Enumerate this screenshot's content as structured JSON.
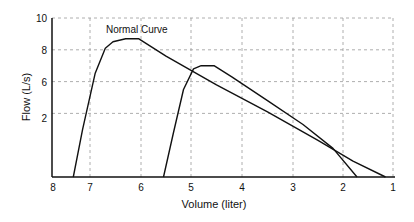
{
  "chart_data": {
    "type": "line",
    "title": "",
    "xlabel": "Volume (liter)",
    "ylabel": "Flow (L/s)",
    "xlim": [
      8,
      1
    ],
    "ylim": [
      0,
      10
    ],
    "x_reversed": true,
    "grid": true,
    "x_ticks": [
      "8",
      "7",
      "6",
      "5",
      "4",
      "3",
      "2",
      "1"
    ],
    "y_ticks": [
      {
        "label": "10",
        "value": 10
      },
      {
        "label": "8",
        "value": 8
      },
      {
        "label": "6",
        "value": 6
      },
      {
        "label": "2",
        "value": 4
      }
    ],
    "annotations": [
      {
        "text": "Normal Curve",
        "x": 6.9,
        "y": 9.2
      }
    ],
    "series": [
      {
        "name": "Normal Curve",
        "points": [
          [
            7.45,
            0
          ],
          [
            7.2,
            3.0
          ],
          [
            6.9,
            6.5
          ],
          [
            6.7,
            8.1
          ],
          [
            6.55,
            8.5
          ],
          [
            6.3,
            8.7
          ],
          [
            6.05,
            8.7
          ],
          [
            5.5,
            7.6
          ],
          [
            4.5,
            5.8
          ],
          [
            3.5,
            4.1
          ],
          [
            2.5,
            2.3
          ],
          [
            1.8,
            1.0
          ],
          [
            1.15,
            0
          ]
        ]
      },
      {
        "name": "Second Curve",
        "points": [
          [
            5.55,
            0
          ],
          [
            5.35,
            2.8
          ],
          [
            5.15,
            5.5
          ],
          [
            4.95,
            6.8
          ],
          [
            4.8,
            7.0
          ],
          [
            4.55,
            7.0
          ],
          [
            4.2,
            6.3
          ],
          [
            3.5,
            4.8
          ],
          [
            2.8,
            3.3
          ],
          [
            2.2,
            1.8
          ],
          [
            1.72,
            0
          ]
        ]
      }
    ]
  }
}
